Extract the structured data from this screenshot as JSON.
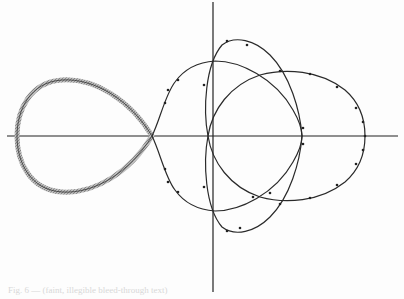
{
  "figure": {
    "axes": {
      "x_axis_y": 136,
      "y_axis_x": 213
    },
    "colors": {
      "curve": "#2a2a2a",
      "shade": "#9a9a9a",
      "background": "#fdfdfd"
    },
    "caption": "Fig. 6 — (faint, illegible bleed-through text)"
  }
}
